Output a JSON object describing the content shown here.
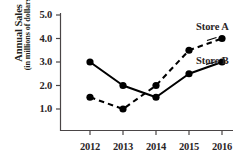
{
  "chart_data": {
    "type": "line",
    "title": "",
    "xlabel": "",
    "ylabel": "Annual Sales (in millions of dollars)",
    "ylabel_line1": "Annual Sales",
    "ylabel_line2": "(in millions of dollars)",
    "categories": [
      "2012",
      "2013",
      "2014",
      "2015",
      "2016"
    ],
    "x": [
      2012,
      2013,
      2014,
      2015,
      2016
    ],
    "xlim": [
      2011.6,
      2016.4
    ],
    "ylim": [
      0.35,
      5.2
    ],
    "yticks": [
      1.0,
      2.0,
      3.0,
      4.0,
      5.0
    ],
    "ytick_labels": [
      "1.0",
      "2.0",
      "3.0",
      "4.0",
      "5.0"
    ],
    "xtick_labels": [
      "2012",
      "2013",
      "2014",
      "2015",
      "2016"
    ],
    "grid": false,
    "legend": "inline-right",
    "series": [
      {
        "name": "Store A",
        "label": "Store A",
        "values": [
          1.5,
          1.0,
          2.0,
          3.5,
          4.0
        ],
        "line_style": "dashed",
        "color": "#000000",
        "marker": "filled-circle"
      },
      {
        "name": "Store B",
        "label": "Store B",
        "values": [
          3.0,
          2.0,
          1.5,
          2.5,
          3.0
        ],
        "line_style": "solid",
        "color": "#000000",
        "marker": "filled-circle"
      }
    ]
  },
  "colors": {
    "background": "#ffffff",
    "ink": "#231f20",
    "axis": "#4a4546",
    "series_a": "#000000",
    "series_b": "#000000"
  },
  "axis": {
    "y_title_line1": "Annual Sales",
    "y_title_line2": "(in millions of dollars)",
    "y_ticks": [
      "5.0",
      "4.0",
      "3.0",
      "2.0",
      "1.0"
    ],
    "x_ticks": [
      "2012",
      "2013",
      "2014",
      "2015",
      "2016"
    ]
  },
  "labels": {
    "store_a": "Store A",
    "store_b": "Store B"
  }
}
